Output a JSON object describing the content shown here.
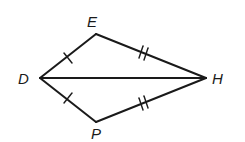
{
  "diagram": {
    "type": "geometry-kite",
    "points": {
      "D": {
        "label": "D",
        "x": 40,
        "y": 78
      },
      "E": {
        "label": "E",
        "x": 96,
        "y": 34
      },
      "H": {
        "label": "H",
        "x": 206,
        "y": 78
      },
      "P": {
        "label": "P",
        "x": 96,
        "y": 122
      }
    },
    "segments": [
      {
        "from": "D",
        "to": "E",
        "ticks": 1
      },
      {
        "from": "E",
        "to": "H",
        "ticks": 2
      },
      {
        "from": "D",
        "to": "P",
        "ticks": 1
      },
      {
        "from": "P",
        "to": "H",
        "ticks": 2
      },
      {
        "from": "D",
        "to": "H",
        "ticks": 0
      }
    ],
    "colors": {
      "stroke": "#1a1a1a",
      "background": "#ffffff"
    }
  }
}
